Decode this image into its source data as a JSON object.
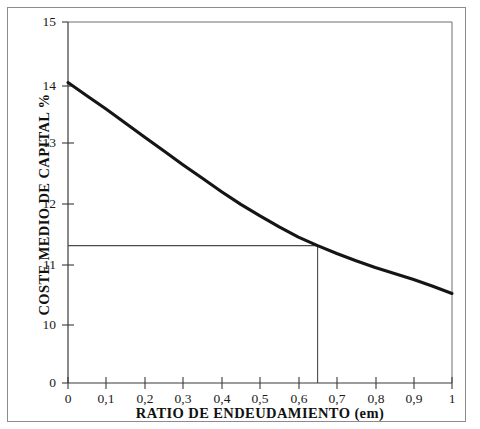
{
  "figure": {
    "background_color": "#ffffff",
    "frame_color": "#8c8c8c",
    "curve_color": "#151515",
    "axis_color": "#3a3a3a",
    "guide_color": "#4a4a4a"
  },
  "chart_data": {
    "type": "line",
    "title": "",
    "subtitle": "",
    "xlabel": "RATIO DE ENDEUDAMIENTO (em)",
    "ylabel": "COSTE MEDIO DE CAPITAL %",
    "xlim": [
      0,
      1
    ],
    "ylim": [
      0,
      15
    ],
    "y_axis_broken": true,
    "y_break_note": "axis jumps from 0 directly to 10",
    "grid": false,
    "legend": false,
    "legend_position": "none",
    "xticks": [
      0,
      0.1,
      0.2,
      0.3,
      0.4,
      0.5,
      0.6,
      0.7,
      0.8,
      0.9,
      1
    ],
    "xticklabels": [
      "0",
      "0,1",
      "0,2",
      "0,3",
      "0,4",
      "0,5",
      "0,6",
      "0,7",
      "0,8",
      "0,9",
      "1"
    ],
    "yticks": [
      0,
      10,
      11,
      12,
      13,
      14,
      15
    ],
    "yticklabels": [
      "0",
      "10",
      "11",
      "12",
      "13",
      "14",
      "15"
    ],
    "series": [
      {
        "name": "Coste medio ponderado de capital",
        "x": [
          0,
          0.05,
          0.1,
          0.15,
          0.2,
          0.25,
          0.3,
          0.35,
          0.4,
          0.45,
          0.5,
          0.55,
          0.6,
          0.65,
          0.7,
          0.75,
          0.8,
          0.85,
          0.9,
          0.95,
          1
        ],
        "values": [
          14.0,
          13.78,
          13.56,
          13.33,
          13.1,
          12.87,
          12.64,
          12.42,
          12.2,
          11.99,
          11.8,
          11.62,
          11.45,
          11.31,
          11.18,
          11.06,
          10.95,
          10.85,
          10.75,
          10.64,
          10.52
        ]
      }
    ],
    "annotations": [
      {
        "name": "optimal-point-horizontal-guide",
        "type": "hline",
        "y": 11.31,
        "x_from": 0,
        "x_to": 0.65
      },
      {
        "name": "optimal-point-vertical-guide",
        "type": "vline",
        "x": 0.65,
        "y_from": 0,
        "y_to": 11.31
      }
    ]
  },
  "axes": {
    "x_title": "RATIO DE ENDEUDAMIENTO (em)",
    "y_title": "COSTE MEDIO DE CAPITAL %",
    "x_tick_labels": [
      "0",
      "0,1",
      "0,2",
      "0,3",
      "0,4",
      "0,5",
      "0,6",
      "0,7",
      "0,8",
      "0,9",
      "1"
    ],
    "y_tick_labels": [
      "0",
      "10",
      "11",
      "12",
      "13",
      "14",
      "15"
    ]
  }
}
